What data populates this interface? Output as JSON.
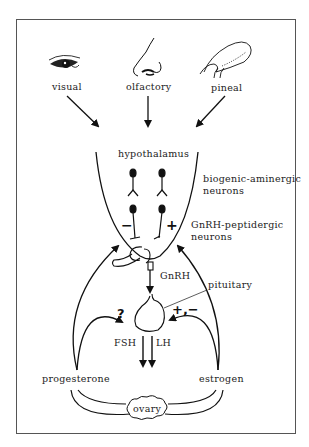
{
  "figure": {
    "inputs": [
      {
        "label": "visual",
        "icon": "eye-icon"
      },
      {
        "label": "olfactory",
        "icon": "nose-icon"
      },
      {
        "label": "pineal",
        "icon": "pineal-gland-icon"
      }
    ],
    "hypothalamus_label": "hypothalamus",
    "biogenic_label_line1": "biogenic-aminergic",
    "biogenic_label_line2": "neurons",
    "gnrh_neurons_label_line1": "GnRH-peptidergic",
    "gnrh_neurons_label_line2": "neurons",
    "inhibit_sign": "−",
    "stimulate_sign": "+",
    "gnrh_label": "GnRH",
    "pituitary_label": "pituitary",
    "unknown_sign": "?",
    "mixed_sign": "+,−",
    "fsh_label": "FSH",
    "lh_label": "LH",
    "progesterone_label": "progesterone",
    "estrogen_label": "estrogen",
    "ovary_label": "ovary"
  }
}
